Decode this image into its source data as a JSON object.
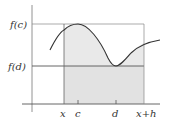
{
  "diagram": {
    "type": "integral-mean-value",
    "y_labels": {
      "f_c": "f(c)",
      "f_d": "f(d)"
    },
    "x_labels": {
      "x": "x",
      "c": "c",
      "d": "d",
      "x_plus_h": "x+h"
    },
    "colors": {
      "shade": "#e8e8e8",
      "lines": "#555555",
      "curve": "#333333",
      "text": "#333333"
    }
  }
}
